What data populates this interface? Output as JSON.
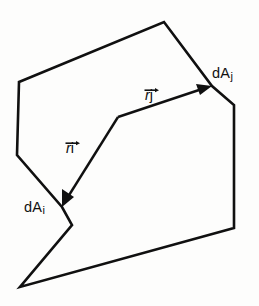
{
  "figure": {
    "background_color": "#fdfdfc",
    "ink_color": "#101010",
    "width": 259,
    "height": 306,
    "labels": {
      "area_j": {
        "base": "dA",
        "subscript": "j"
      },
      "area_i": {
        "base": "dA",
        "subscript": "i"
      },
      "vector_j": {
        "base": "r",
        "subscript": "j",
        "accent": "arrow"
      },
      "vector_i": {
        "base": "r",
        "subscript": "i",
        "accent": "arrow"
      }
    },
    "geometry": {
      "enclosure_outline_points": "19,82 164,22 212,86 234,105 234,228 20,287 72,225 62,207 17,155",
      "vector_j_line": {
        "x1": 118,
        "y1": 117,
        "x2": 207,
        "y2": 88
      },
      "vector_i_line": {
        "x1": 118,
        "y1": 117,
        "x2": 65,
        "y2": 202
      },
      "vector_j_head": "212,86 196,84 200,95",
      "vector_i_head": "62,207 62,189 74,197",
      "origin_vertex": {
        "x": 118,
        "y": 117
      }
    }
  }
}
